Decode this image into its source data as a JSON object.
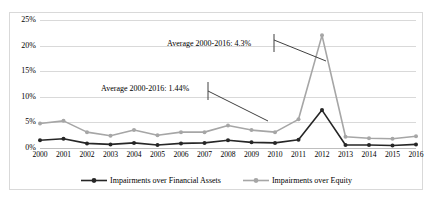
{
  "chart_data": {
    "type": "line",
    "title": "",
    "subtitle": "",
    "xlabel": "",
    "ylabel": "",
    "ylim": [
      0,
      25
    ],
    "ytick_labels": [
      "0%",
      "5%",
      "10%",
      "15%",
      "20%",
      "25%"
    ],
    "ytick_values": [
      0,
      5,
      10,
      15,
      20,
      25
    ],
    "grid": true,
    "legend_position": "bottom",
    "categories": [
      "2000",
      "2001",
      "2002",
      "2003",
      "2004",
      "2005",
      "2006",
      "2007",
      "2008",
      "2009",
      "2010",
      "2011",
      "2012",
      "2013",
      "2014",
      "2015",
      "2016"
    ],
    "series": [
      {
        "name": "Impairments over Financial Assets",
        "color": "#262626",
        "marker": "circle",
        "values": [
          1.5,
          1.8,
          0.9,
          0.7,
          1.0,
          0.6,
          0.9,
          1.0,
          1.5,
          1.1,
          1.0,
          1.6,
          7.4,
          0.6,
          0.6,
          0.5,
          0.7
        ]
      },
      {
        "name": "Impairments over Equity",
        "color": "#a6a6a6",
        "marker": "circle",
        "values": [
          4.8,
          5.3,
          3.1,
          2.4,
          3.5,
          2.5,
          3.1,
          3.1,
          4.4,
          3.5,
          3.1,
          5.6,
          22.0,
          2.2,
          1.9,
          1.8,
          2.3
        ]
      }
    ],
    "annotations": [
      {
        "text": "Average 2000-2016: 1.44%",
        "series": "Impairments over Financial Assets"
      },
      {
        "text": "Average 2000-2016: 4.3%",
        "series": "Impairments over Equity"
      }
    ]
  },
  "legend": {
    "items": [
      {
        "label": "Impairments over Financial Assets",
        "color": "#262626"
      },
      {
        "label": "Impairments over Equity",
        "color": "#a6a6a6"
      }
    ]
  },
  "colors": {
    "series_financial_assets": "#262626",
    "series_equity": "#a6a6a6",
    "gridline": "#d9d9d9",
    "frame": "#d9d9d9",
    "annotation": "#404040"
  }
}
